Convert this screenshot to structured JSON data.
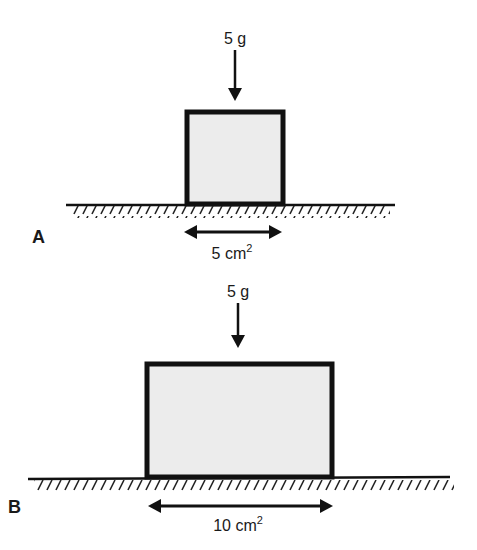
{
  "figure": {
    "panels": [
      {
        "id": "A",
        "label": "A",
        "force_label": "5 g",
        "area_label": "5 cm",
        "area_exponent": "2"
      },
      {
        "id": "B",
        "label": "B",
        "force_label": "5 g",
        "area_label": "10 cm",
        "area_exponent": "2"
      }
    ],
    "colors": {
      "line": "#111111",
      "block_fill": "#ececec",
      "background": "#ffffff"
    }
  }
}
